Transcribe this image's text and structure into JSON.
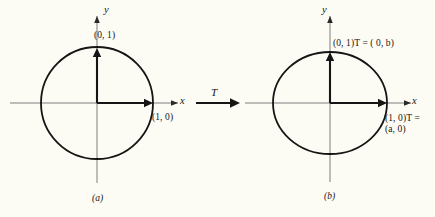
{
  "figure": {
    "background_color": "#fdfcf4",
    "ink_color": "#151515",
    "axis_color": "#6e6e6e",
    "width": 435,
    "height": 217
  },
  "transform_arrow": {
    "label": "T",
    "name": "transformation-operator"
  },
  "panels": [
    {
      "id": "a",
      "caption": "(a)",
      "shape": "circle",
      "axes": {
        "x_label": "x",
        "y_label": "y"
      },
      "origin": {
        "x": 97,
        "y": 103
      },
      "radius": {
        "x": 56,
        "y": 56
      },
      "vectors": [
        {
          "name": "unit-vector-e2",
          "label": "(0, 1)",
          "tip": {
            "x": 97,
            "y": 48
          }
        },
        {
          "name": "unit-vector-e1",
          "label": "(1, 0)",
          "tip": {
            "x": 153,
            "y": 103
          }
        }
      ]
    },
    {
      "id": "b",
      "caption": "(b)",
      "shape": "ellipse",
      "axes": {
        "x_label": "x",
        "y_label": "y"
      },
      "origin": {
        "x": 330,
        "y": 103
      },
      "radius": {
        "x": 57,
        "y": 51
      },
      "vectors": [
        {
          "name": "image-vector-e2",
          "label": "(0, 1)T = ( 0, b)",
          "tip": {
            "x": 330,
            "y": 52
          }
        },
        {
          "name": "image-vector-e1",
          "label_line1": "(1, 0)T =",
          "label_line2": "(a, 0)",
          "tip": {
            "x": 387,
            "y": 103
          }
        }
      ]
    }
  ]
}
